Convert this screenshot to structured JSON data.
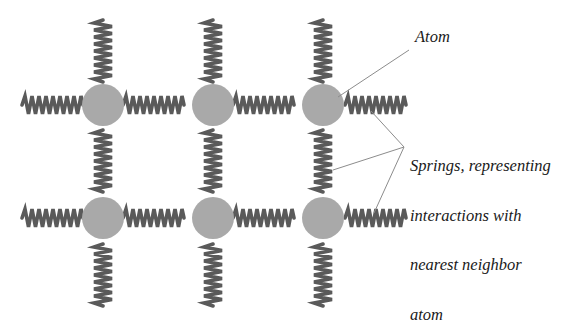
{
  "diagram": {
    "type": "lattice-spring-model",
    "grid": {
      "rows": 2,
      "cols": 3
    },
    "atom_color": "#a9a9a9",
    "spring_color": "#5a5a5a",
    "pointer_color": "#8c8c8c",
    "atoms": [
      {
        "row": 1,
        "col": 1,
        "cx": 103,
        "cy": 105
      },
      {
        "row": 1,
        "col": 2,
        "cx": 213,
        "cy": 105
      },
      {
        "row": 1,
        "col": 3,
        "cx": 323,
        "cy": 105
      },
      {
        "row": 2,
        "col": 1,
        "cx": 103,
        "cy": 218
      },
      {
        "row": 2,
        "col": 2,
        "cx": 213,
        "cy": 218
      },
      {
        "row": 2,
        "col": 3,
        "cx": 323,
        "cy": 218
      }
    ],
    "atom_radius": 21
  },
  "labels": {
    "atom": "Atom",
    "springs": {
      "line1": "Springs, representing",
      "line2": "interactions with",
      "line3": "nearest neighbor",
      "line4": "atom"
    }
  }
}
